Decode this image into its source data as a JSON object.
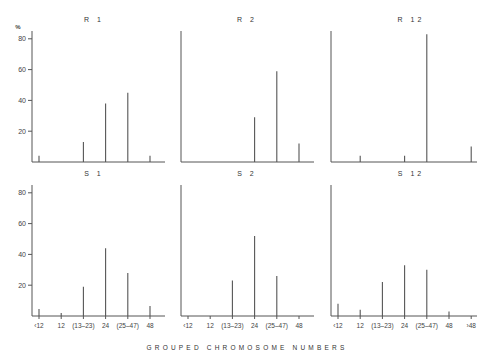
{
  "chart_data": {
    "type": "bar",
    "layout": "2x3 small multiples",
    "xlabel": "GROUPED CHROMOSOME NUMBERS",
    "ylabel": "%",
    "ylim": [
      0,
      85
    ],
    "yticks": [
      20,
      40,
      60,
      80
    ],
    "categories": [
      "‹12",
      "12",
      "(13–23)",
      "24",
      "(25–47)",
      "48",
      "›48"
    ],
    "grid": false,
    "panels": [
      {
        "title": "R 1",
        "row": "top",
        "show_yticks": true,
        "show_xtick_labels": false,
        "values": [
          4,
          0,
          13,
          38,
          45,
          4,
          null
        ]
      },
      {
        "title": "R 2",
        "row": "top",
        "show_yticks": false,
        "show_xtick_labels": false,
        "values": [
          0,
          0,
          0,
          29,
          59,
          12,
          null
        ]
      },
      {
        "title": "R 12",
        "row": "top",
        "show_yticks": false,
        "show_xtick_labels": false,
        "values": [
          0,
          4,
          0,
          4,
          83,
          0,
          10
        ]
      },
      {
        "title": "S 1",
        "row": "bottom",
        "show_yticks": true,
        "show_xtick_labels": true,
        "values": [
          4.5,
          2,
          19,
          44,
          28,
          6.5,
          null
        ]
      },
      {
        "title": "S 2",
        "row": "bottom",
        "show_yticks": false,
        "show_xtick_labels": true,
        "values": [
          0,
          0,
          23,
          52,
          26,
          0,
          null
        ]
      },
      {
        "title": "S 12",
        "row": "bottom",
        "show_yticks": false,
        "show_xtick_labels": true,
        "values": [
          8,
          4,
          22,
          33,
          30,
          3,
          0
        ]
      }
    ]
  }
}
